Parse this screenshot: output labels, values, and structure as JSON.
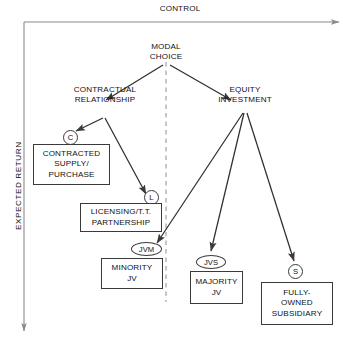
{
  "figure": {
    "axes": {
      "horizontal": {
        "label": "CONTROL",
        "direction": "right"
      },
      "vertical": {
        "label": "EXPECTED RETURN",
        "direction": "down"
      }
    },
    "divider": {
      "style": "dashed",
      "orientation": "vertical"
    },
    "root": {
      "label": "MODAL\nCHOICE"
    },
    "branches": [
      {
        "label": "CONTRACTUAL\nRELATIONSHIP"
      },
      {
        "label": "EQUITY\nINVESTMENT"
      }
    ],
    "nodes": [
      {
        "tag": "C",
        "shape": "circle",
        "label": "CONTRACTED\nSUPPLY/\nPURCHASE"
      },
      {
        "tag": "L",
        "shape": "circle",
        "label": "LICENSING/T.T.\nPARTNERSHIP"
      },
      {
        "tag": "JVM",
        "shape": "ellipse",
        "label": "MINORITY\nJV"
      },
      {
        "tag": "JVS",
        "shape": "ellipse",
        "label": "MAJORITY\nJV"
      },
      {
        "tag": "S",
        "shape": "circle",
        "label": "FULLY-\nOWNED\nSUBSIDIARY"
      }
    ],
    "colors": {
      "stroke": "#3a3a3a",
      "text": "#111111",
      "divider": "#b9b9b9",
      "background": "#ffffff"
    }
  }
}
